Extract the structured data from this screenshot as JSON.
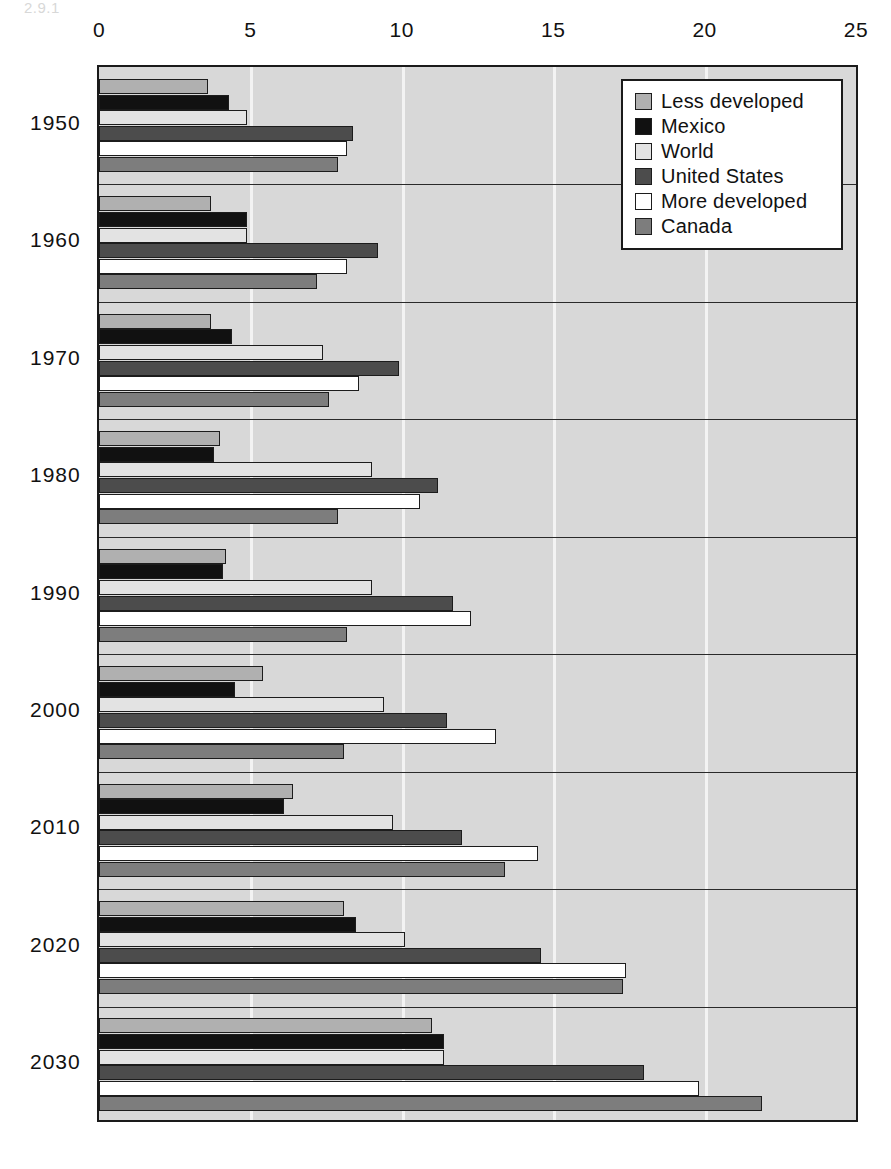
{
  "page": {
    "clipped_header_text": "2.9.1"
  },
  "chart_data": {
    "type": "bar",
    "orientation": "horizontal",
    "title": "",
    "xlabel": "",
    "ylabel": "",
    "xlim": [
      0,
      25
    ],
    "xticks": [
      0,
      5,
      10,
      15,
      20,
      25
    ],
    "xtick_labels": [
      "0",
      "5",
      "10",
      "15",
      "20",
      "25"
    ],
    "categories": [
      "1950",
      "1960",
      "1970",
      "1980",
      "1990",
      "2000",
      "2010",
      "2020",
      "2030"
    ],
    "grid": "vertical",
    "legend_position": "top-right",
    "series": [
      {
        "name": "Less developed",
        "color": "#b0b0b0",
        "values": [
          3.6,
          3.7,
          3.7,
          4.0,
          4.2,
          5.4,
          6.4,
          8.1,
          11.0
        ]
      },
      {
        "name": "Mexico",
        "color": "#111111",
        "values": [
          4.3,
          4.9,
          4.4,
          3.8,
          4.1,
          4.5,
          6.1,
          8.5,
          11.4
        ]
      },
      {
        "name": "World",
        "color": "#e3e3e3",
        "values": [
          4.9,
          4.9,
          7.4,
          9.0,
          9.0,
          9.4,
          9.7,
          10.1,
          11.4
        ]
      },
      {
        "name": "United States",
        "color": "#4c4c4c",
        "values": [
          8.4,
          9.2,
          9.9,
          11.2,
          11.7,
          11.5,
          12.0,
          14.6,
          18.0
        ]
      },
      {
        "name": "More developed",
        "color": "#ffffff",
        "values": [
          8.2,
          8.2,
          8.6,
          10.6,
          12.3,
          13.1,
          14.5,
          17.4,
          19.8
        ]
      },
      {
        "name": "Canada",
        "color": "#7d7d7d",
        "values": [
          7.9,
          7.2,
          7.6,
          7.9,
          8.2,
          8.1,
          13.4,
          17.3,
          21.9
        ]
      }
    ]
  }
}
